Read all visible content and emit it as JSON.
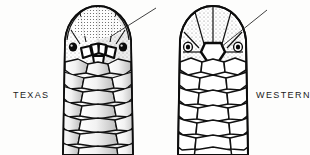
{
  "illustration": {
    "type": "comparative-scientific-line-drawing",
    "subject": "dorsal view of snake head scalation",
    "background_color": "#fdfdfc",
    "ink_color": "#111111"
  },
  "figures": [
    {
      "id": "texas",
      "caption": "TEXAS",
      "caption_position": "left",
      "shading": "stippled",
      "leader_line": {
        "present": true,
        "points_to": "internasal-prefrontal scale group",
        "direction": "from upper-right to head"
      },
      "diagnostic_scales": {
        "count": 4,
        "description": "row of small scales between the eyes"
      },
      "body_scale_rows": 7,
      "eyes": 2
    },
    {
      "id": "western",
      "caption": "WESTERN",
      "caption_position": "right",
      "shading": "outline",
      "leader_line": {
        "present": true,
        "points_to": "single large frontal scale",
        "direction": "from upper-right to head"
      },
      "diagnostic_scales": {
        "count": 1,
        "description": "single large scale between the eyes"
      },
      "body_scale_rows": 7,
      "eyes": 2
    }
  ],
  "colors": {
    "ink": "#111111",
    "background": "#fdfdfc",
    "stipple": "#6e6e6e",
    "caption": "#1a1a1a"
  }
}
